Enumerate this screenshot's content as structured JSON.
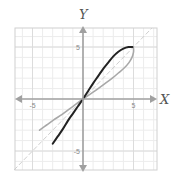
{
  "chart_data": {
    "type": "line",
    "title": "",
    "xlabel": "X",
    "ylabel": "Y",
    "xlim": [
      -6.8,
      7.4
    ],
    "ylim": [
      -6.9,
      6.9
    ],
    "grid": true,
    "grid_step": 1,
    "x_tick_labels": [
      {
        "value": -5,
        "label": "-5"
      },
      {
        "value": 5,
        "label": "5"
      }
    ],
    "y_tick_labels": [
      {
        "value": 5,
        "label": "5"
      },
      {
        "value": -5,
        "label": "-5"
      }
    ],
    "series": [
      {
        "name": "f(x)",
        "color": "#222222",
        "width": 2,
        "points": [
          [
            -3.0,
            -4.3
          ],
          [
            -2.5,
            -3.6
          ],
          [
            -2.0,
            -2.9
          ],
          [
            -1.5,
            -2.1
          ],
          [
            -1.0,
            -1.4
          ],
          [
            -0.5,
            -0.7
          ],
          [
            0,
            0
          ],
          [
            0.5,
            0.75
          ],
          [
            1.0,
            1.5
          ],
          [
            1.5,
            2.2
          ],
          [
            2.0,
            2.9
          ],
          [
            2.5,
            3.5
          ],
          [
            3.0,
            4.1
          ],
          [
            3.5,
            4.55
          ],
          [
            4.0,
            4.85
          ],
          [
            4.5,
            5.0
          ],
          [
            4.9,
            5.0
          ]
        ]
      },
      {
        "name": "f^-1(x)",
        "color": "#a8a8a8",
        "width": 1.6,
        "points": [
          [
            -4.3,
            -3.0
          ],
          [
            -3.6,
            -2.5
          ],
          [
            -2.9,
            -2.0
          ],
          [
            -2.1,
            -1.5
          ],
          [
            -1.4,
            -1.0
          ],
          [
            -0.7,
            -0.5
          ],
          [
            0,
            0
          ],
          [
            0.75,
            0.5
          ],
          [
            1.5,
            1.0
          ],
          [
            2.2,
            1.5
          ],
          [
            2.9,
            2.0
          ],
          [
            3.5,
            2.5
          ],
          [
            4.1,
            3.0
          ],
          [
            4.55,
            3.5
          ],
          [
            4.85,
            4.0
          ],
          [
            5.0,
            4.5
          ],
          [
            5.0,
            4.9
          ]
        ]
      },
      {
        "name": "y = x",
        "color": "#cfcfcf",
        "width": 1,
        "dashed": true,
        "points": [
          [
            -6.8,
            -6.8
          ],
          [
            6.8,
            6.8
          ]
        ]
      }
    ],
    "legend": null
  },
  "layout": {
    "plot_box": {
      "x": 15,
      "y": 28,
      "w": 142,
      "h": 142
    },
    "origin_px": {
      "x": 83,
      "y": 99
    },
    "px_per_unit": {
      "x": 10.1,
      "y": 10.4
    },
    "colors": {
      "grid": "#ececec",
      "border": "#d0d0d0",
      "axis": "#a0a0a0"
    }
  }
}
